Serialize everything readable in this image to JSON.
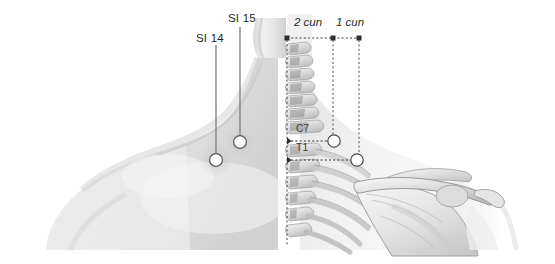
{
  "figure": {
    "background_color": "#ffffff",
    "width": 555,
    "height": 264
  },
  "point_labels": [
    {
      "id": "si14",
      "text": "SI 14",
      "x": 196,
      "y": 32,
      "leader_from_x": 216,
      "leader_from_y": 45,
      "leader_to_x": 216,
      "leader_to_y": 155,
      "marker_x": 216,
      "marker_y": 160
    },
    {
      "id": "si15",
      "text": "SI 15",
      "x": 228,
      "y": 12,
      "leader_from_x": 240,
      "leader_from_y": 27,
      "leader_to_x": 240,
      "leader_to_y": 137,
      "marker_x": 240,
      "marker_y": 142
    }
  ],
  "measurements": {
    "axis_y": 38,
    "ticks": [
      {
        "id": "tick-left",
        "x": 287
      },
      {
        "id": "tick-mid",
        "x": 333
      },
      {
        "id": "tick-right",
        "x": 359
      }
    ],
    "labels": [
      {
        "id": "cun2",
        "text": "2 cun",
        "x": 294,
        "y": 16
      },
      {
        "id": "cun1",
        "text": "1 cun",
        "x": 336,
        "y": 16
      }
    ],
    "drop_lines": [
      {
        "id": "drop-mid",
        "x": 333,
        "y1": 38,
        "y2": 141
      },
      {
        "id": "drop-right",
        "x": 359,
        "y1": 38,
        "y2": 160
      }
    ],
    "markers": [
      {
        "id": "marker-si15-skeletal",
        "x": 334,
        "y": 141
      },
      {
        "id": "marker-si14-skeletal",
        "x": 357,
        "y": 160
      }
    ]
  },
  "vertebrae": [
    {
      "id": "c7",
      "text": "C7",
      "x": 296,
      "y": 123,
      "level_y": 141,
      "level_x1": 287,
      "level_x2": 330
    },
    {
      "id": "t1",
      "text": "T1",
      "x": 296,
      "y": 142,
      "level_y": 160,
      "level_x1": 287,
      "level_x2": 352
    }
  ],
  "midline": {
    "x": 287,
    "y1": 38,
    "y2": 245
  },
  "colors": {
    "leader_line": "#7a7a7a",
    "dashed_line": "#3c3c3c",
    "marker_fill": "#ffffff",
    "marker_stroke": "#4a4a4a",
    "skin_light": "#f2f2f2",
    "skin_mid": "#dcdcdc",
    "skin_shadow": "#c4c4c4",
    "bone_light": "#f4f4f4",
    "bone_mid": "#d6d6d6",
    "bone_dark": "#a8a8a8",
    "text": "#2b2b2b"
  },
  "anatomy": {
    "left_half": "soft-tissue rendering of neck, trapezius and shoulder",
    "right_half": "skeletal rendering of cervical and thoracic vertebrae, ribs, scapula and clavicle"
  }
}
